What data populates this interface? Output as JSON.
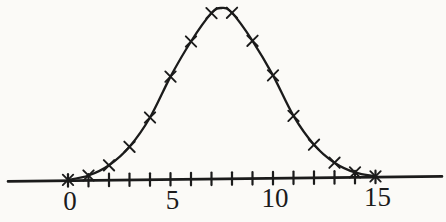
{
  "figure": {
    "background_color": "#fbfaf7",
    "ink_color": "#1b1b1b"
  },
  "chart_data": {
    "type": "line",
    "marker": "x-cross",
    "x": [
      0,
      1,
      2,
      3,
      4,
      5,
      6,
      7,
      8,
      9,
      10,
      11,
      12,
      13,
      14,
      15
    ],
    "relative_heights": [
      0.005,
      0.03,
      0.09,
      0.2,
      0.375,
      0.62,
      0.83,
      1.0,
      1.0,
      0.83,
      0.62,
      0.375,
      0.2,
      0.09,
      0.03,
      0.005
    ],
    "peak": {
      "x": 7.5,
      "relative_height": 1.03
    },
    "x_axis": {
      "tick_positions": [
        0,
        1,
        2,
        3,
        4,
        5,
        6,
        7,
        8,
        9,
        10,
        11,
        12,
        13,
        14,
        15
      ],
      "labeled_ticks": [
        {
          "value": 0,
          "label": "0"
        },
        {
          "value": 5,
          "label": "5"
        },
        {
          "value": 10,
          "label": "10"
        },
        {
          "value": 15,
          "label": "15"
        }
      ],
      "range_shown": [
        0,
        15
      ]
    },
    "y_axis": {
      "visible": false
    },
    "grid": false,
    "legend": null
  }
}
